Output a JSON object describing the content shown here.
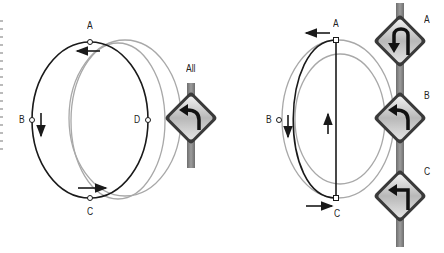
{
  "left_figure": {
    "points": [
      {
        "id": "A",
        "label": "A"
      },
      {
        "id": "B",
        "label": "B"
      },
      {
        "id": "C",
        "label": "C"
      },
      {
        "id": "D",
        "label": "D"
      }
    ],
    "sign_caption": "All",
    "sign_icon": "curve-left-sign-icon"
  },
  "right_figure": {
    "points": [
      {
        "id": "A",
        "label": "A"
      },
      {
        "id": "B",
        "label": "B"
      },
      {
        "id": "C",
        "label": "C"
      }
    ],
    "signs": [
      {
        "label": "A",
        "icon": "u-turn-left-sign-icon"
      },
      {
        "label": "B",
        "icon": "curve-left-sign-icon"
      },
      {
        "label": "C",
        "icon": "sharp-turn-left-sign-icon"
      }
    ]
  },
  "colors": {
    "path_black": "#1a1a1a",
    "path_gray": "#a0a0a0",
    "pole": "#8a8a8a",
    "sign_face": "#d8d8d8",
    "sign_border": "#3a3a3a"
  }
}
